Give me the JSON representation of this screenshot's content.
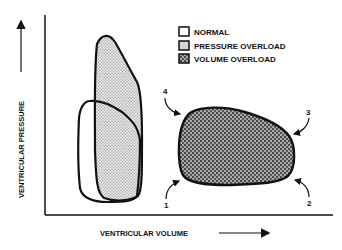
{
  "diagram": {
    "y_axis_label": "VENTRICULAR PRESSURE",
    "x_axis_label": "VENTRICULAR VOLUME",
    "legend": [
      {
        "label": "NORMAL",
        "pattern": "none"
      },
      {
        "label": "PRESSURE OVERLOAD",
        "pattern": "fine-stipple"
      },
      {
        "label": "VOLUME OVERLOAD",
        "pattern": "coarse-stipple"
      }
    ],
    "point_labels": [
      "1",
      "2",
      "3",
      "4"
    ],
    "colors": {
      "stroke": "#111111",
      "background": "#ffffff",
      "pressure_fill": "#c8c8c8",
      "volume_fill": "#7a7a7a"
    }
  }
}
